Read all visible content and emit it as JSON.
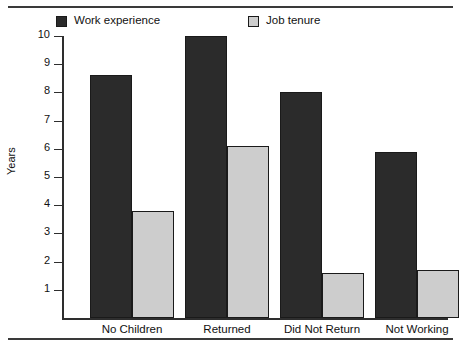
{
  "figure": {
    "background_color": "#ffffff",
    "rule_color": "#3a3a3a"
  },
  "legend": {
    "position": "top",
    "items": [
      {
        "label": "Work experience",
        "color": "#2b2b2b",
        "swatch_name": "legend-swatch-work-experience"
      },
      {
        "label": "Job tenure",
        "color": "#cdcdcd",
        "swatch_name": "legend-swatch-job-tenure"
      }
    ]
  },
  "axes": {
    "ylabel": "Years",
    "yticks": [
      "10",
      "9",
      "8",
      "7",
      "6",
      "5",
      "4",
      "3",
      "2",
      "1"
    ],
    "ylim": [
      0,
      10
    ]
  },
  "chart_data": {
    "type": "bar",
    "title": "",
    "xlabel": "",
    "ylabel": "Years",
    "ylim": [
      0,
      10
    ],
    "yticks": [
      1,
      2,
      3,
      4,
      5,
      6,
      7,
      8,
      9,
      10
    ],
    "grid": false,
    "legend_position": "top",
    "categories": [
      "No Children",
      "Returned",
      "Did Not Return",
      "Not Working"
    ],
    "series": [
      {
        "name": "Work experience",
        "color": "#2b2b2b",
        "values": [
          8.6,
          10.0,
          8.0,
          5.9
        ]
      },
      {
        "name": "Job tenure",
        "color": "#cdcdcd",
        "values": [
          3.8,
          6.1,
          1.6,
          1.7
        ]
      }
    ]
  }
}
